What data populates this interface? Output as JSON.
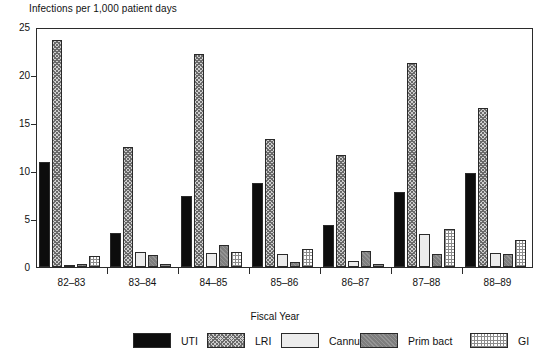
{
  "chart_data": {
    "type": "bar",
    "title": "Infections per 1,000 patient days",
    "xlabel": "Fiscal Year",
    "ylabel": "",
    "ylim": [
      0,
      25
    ],
    "yticks": [
      0,
      5,
      10,
      15,
      20,
      25
    ],
    "grid": false,
    "legend_position": "bottom",
    "categories": [
      "82–83",
      "83–84",
      "84–85",
      "85–86",
      "86–87",
      "87–88",
      "88–89"
    ],
    "series": [
      {
        "name": "UTI",
        "color": "#0d0d0d",
        "pattern": "solid-black",
        "values": [
          10.9,
          3.5,
          7.4,
          8.7,
          4.4,
          7.8,
          9.8
        ]
      },
      {
        "name": "LRI",
        "color": "#cfcfcf",
        "pattern": "crosshatch",
        "values": [
          23.6,
          12.5,
          22.2,
          13.3,
          11.7,
          21.2,
          16.6
        ]
      },
      {
        "name": "Cannula",
        "color": "#ececec",
        "pattern": "light-solid",
        "values": [
          0.2,
          1.6,
          1.5,
          1.4,
          0.6,
          3.4,
          1.5
        ]
      },
      {
        "name": "Prim bact",
        "color": "#7e7e7e",
        "pattern": "dark-gray",
        "values": [
          0.3,
          1.2,
          2.3,
          0.5,
          1.7,
          1.4,
          1.4
        ]
      },
      {
        "name": "GI",
        "color": "#ffffff",
        "pattern": "fine-grid",
        "values": [
          1.1,
          0.3,
          1.6,
          1.9,
          0.3,
          4.0,
          2.8
        ]
      }
    ]
  },
  "legend": {
    "items": [
      {
        "label": "UTI"
      },
      {
        "label": "LRI"
      },
      {
        "label": "Cannula"
      },
      {
        "label": "Prim bact"
      },
      {
        "label": "GI"
      }
    ]
  }
}
